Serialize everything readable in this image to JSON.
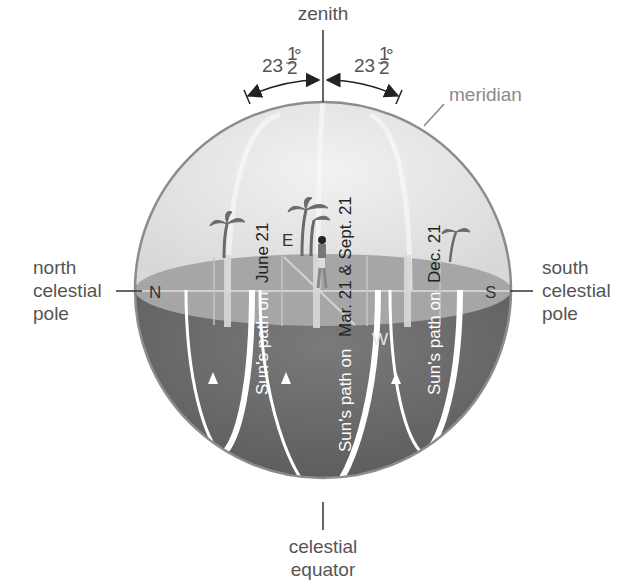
{
  "labels": {
    "zenith": "zenith",
    "angle_left": "23",
    "angle_right": "23",
    "angle_fraction_num": "1",
    "angle_fraction_den": "2",
    "angle_degree": "°",
    "meridian": "meridian",
    "north_pole": [
      "north",
      "celestial",
      "pole"
    ],
    "south_pole": [
      "south",
      "celestial",
      "pole"
    ],
    "celestial_equator": [
      "celestial",
      "equator"
    ]
  },
  "directions": {
    "north": "N",
    "south": "S",
    "east": "E",
    "west": "W"
  },
  "sun_paths": [
    {
      "upper": "June 21",
      "lower": "Sun's path on"
    },
    {
      "upper": "Mar. 21 & Sept. 21",
      "lower": "Sun's path on"
    },
    {
      "upper": "Dec. 21",
      "lower": "Sun's path on"
    }
  ],
  "sun_path_full": [
    "Sun's path on June 21",
    "Sun's path on Mar. 21 & Sept. 21",
    "Sun's path on Dec. 21"
  ],
  "colors": {
    "upper_sky": "#e4e4e4",
    "horizon_plane": "#a8a8a8",
    "lower_sphere": "#6e6e6e",
    "path_line": "#ffffff",
    "outline": "#8c8c8c",
    "palm": "#6a6a6a"
  }
}
